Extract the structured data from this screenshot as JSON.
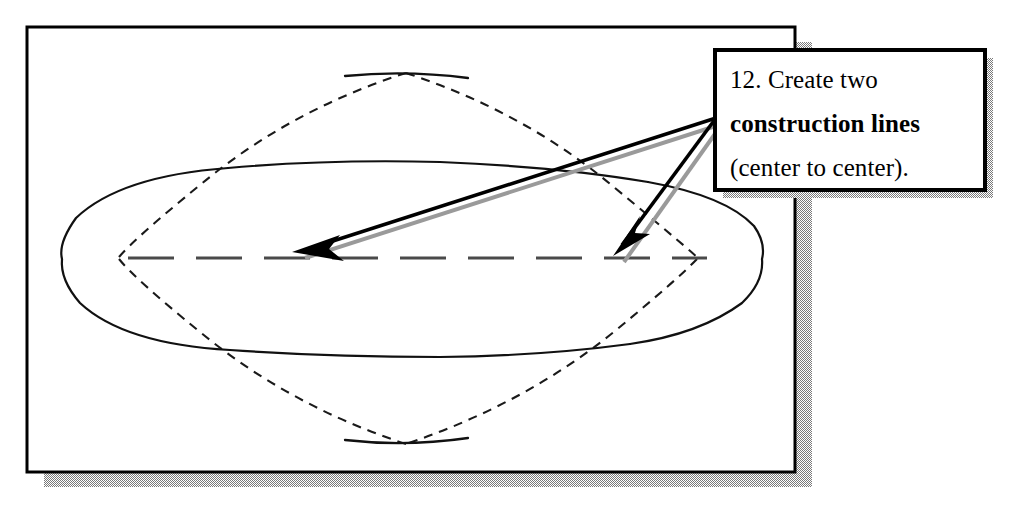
{
  "figure": {
    "kind": "cad-instruction-diagram",
    "canvas": {
      "width": 1013,
      "height": 511,
      "background": "#ffffff"
    },
    "frame": {
      "name": "drawing-viewport",
      "x": 27,
      "y": 27,
      "width": 768,
      "height": 445,
      "border_color": "#000000",
      "border_width": 3,
      "fill": "#ffffff",
      "shadow": {
        "offset_x": 17,
        "offset_y": 15,
        "color": "#808080",
        "pattern": "checkerboard-dither"
      }
    },
    "callout": {
      "name": "instruction-callout",
      "x": 715,
      "y": 50,
      "width": 270,
      "height": 140,
      "border_color": "#000000",
      "border_width": 4,
      "fill": "#ffffff",
      "shadow": {
        "offset_x": 8,
        "offset_y": 8,
        "color": "#808080",
        "pattern": "checkerboard-dither"
      },
      "text": {
        "step_number": "12.",
        "line1": "12. Create two",
        "line2_bold": "construction lines",
        "line3": "(center to center).",
        "full": "12. Create two construction lines (center to center)."
      }
    },
    "centerline": {
      "name": "horizontal-centerline",
      "y": 258,
      "x_start": 128,
      "x_end": 707,
      "style": "dashed",
      "color": "#4a4a4a",
      "dash": "22 12"
    },
    "lens_outline": {
      "name": "solid-lens-profile",
      "style": "solid-thin",
      "color": "#1a1a1a",
      "left_x": 62,
      "right_x": 762,
      "top_y": 170,
      "bottom_y": 348,
      "center_y": 258
    },
    "diamond_outline": {
      "name": "dashed-diamond-profile",
      "style": "dashed-thin",
      "color": "#1a1a1a",
      "apex_top": {
        "x": 406,
        "y": 73
      },
      "apex_bottom": {
        "x": 406,
        "y": 444
      },
      "left_vertex": {
        "x": 118,
        "y": 258
      },
      "right_vertex": {
        "x": 700,
        "y": 258
      }
    },
    "leader_arrows": [
      {
        "name": "leader-arrow-left",
        "from": {
          "x": 716,
          "y": 118
        },
        "to": {
          "x": 292,
          "y": 252
        },
        "style": "solid-with-filled-arrowhead",
        "color": "#000000",
        "has_dither_shadow": true
      },
      {
        "name": "leader-arrow-right",
        "from": {
          "x": 716,
          "y": 118
        },
        "to": {
          "x": 614,
          "y": 256
        },
        "style": "solid-with-filled-arrowhead",
        "color": "#000000",
        "has_dither_shadow": true
      }
    ],
    "colors": {
      "ink": "#000000",
      "line_gray": "#4a4a4a",
      "shadow_gray": "#808080",
      "paper": "#ffffff"
    }
  }
}
